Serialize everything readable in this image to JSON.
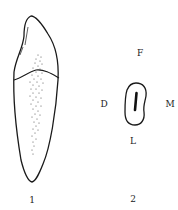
{
  "figure": {
    "panels": [
      {
        "id": "1",
        "label": "1",
        "description": "Tooth, lateral view with crown and root outline and stippled pulp region"
      },
      {
        "id": "2",
        "label": "2",
        "description": "Cross-section of root with root canal",
        "orientation": {
          "top": "F",
          "left": "D",
          "right": "M",
          "bottom": "L"
        }
      }
    ]
  },
  "colors": {
    "line": "#1a1a1a",
    "background": "#ffffff"
  }
}
